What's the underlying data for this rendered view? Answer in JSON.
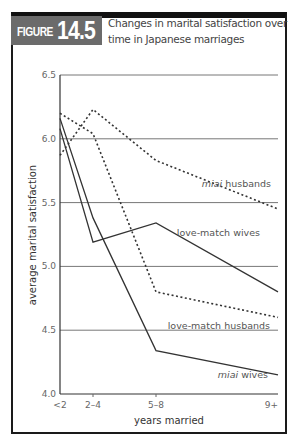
{
  "figure": {
    "label_word": "FIGURE",
    "label_number": "14.5",
    "title": "Changes in marital satisfaction over time in Japanese marriages"
  },
  "colors": {
    "frame": "#1a1a1a",
    "badge_bg": "#6b6b6b",
    "gridline": "#777777",
    "line": "#333333"
  },
  "chart_data": {
    "type": "line",
    "title": "Changes in marital satisfaction over time in Japanese marriages",
    "xlabel": "years married",
    "ylabel": "average marital satisfaction",
    "categories": [
      "<2",
      "2–4",
      "5–8",
      "9+"
    ],
    "x_positions": [
      60,
      93,
      156,
      278
    ],
    "ylim": [
      4.0,
      6.5
    ],
    "yticks": [
      "6.5",
      "6.0",
      "5.5",
      "5.0",
      "4.5",
      "4.0"
    ],
    "ytick_values": [
      6.5,
      6.0,
      5.5,
      5.0,
      4.5,
      4.0
    ],
    "grid": "horizontal",
    "legend_position": "inline labels",
    "series": [
      {
        "name": "miai husbands",
        "label_prefix": "miai",
        "label_suffix": " husbands",
        "style": "dotted",
        "values": [
          5.87,
          6.23,
          5.83,
          5.45
        ]
      },
      {
        "name": "love-match wives",
        "label_prefix": "",
        "label_suffix": "love-match wives",
        "style": "solid",
        "values": [
          6.08,
          5.19,
          5.34,
          4.8
        ]
      },
      {
        "name": "love-match husbands",
        "label_prefix": "",
        "label_suffix": "love-match husbands",
        "style": "dotted",
        "values": [
          6.2,
          6.04,
          4.8,
          4.6
        ]
      },
      {
        "name": "miai wives",
        "label_prefix": "miai",
        "label_suffix": " wives",
        "style": "solid",
        "values": [
          6.16,
          5.38,
          4.34,
          4.15
        ]
      }
    ]
  }
}
